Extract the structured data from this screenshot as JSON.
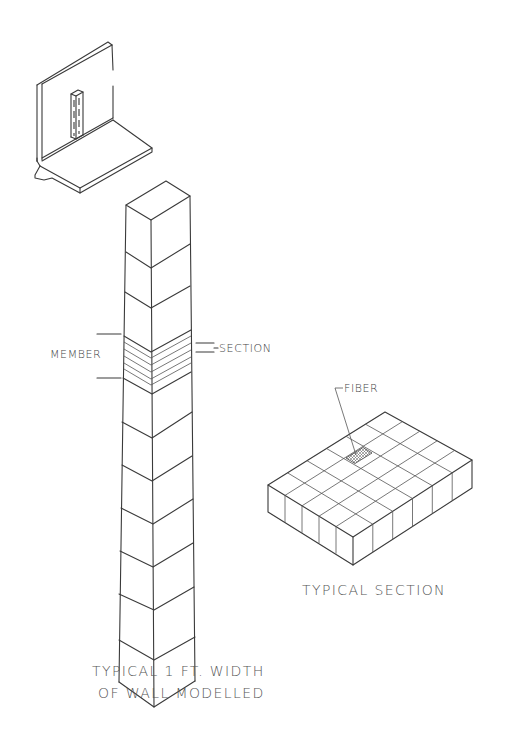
{
  "diagram": {
    "views": [
      {
        "id": "wall-isometric",
        "description": "Cantilever retaining wall with footing, 1 ft strip highlighted"
      },
      {
        "id": "wall-column",
        "description": "Typical 1 ft width of wall modelled as stacked members",
        "segments": 9
      },
      {
        "id": "typical-section",
        "description": "Fiber-discretized cross section",
        "grid_left_divisions": 6,
        "grid_right_divisions": 5
      }
    ],
    "labels": {
      "member": "MEMBER",
      "section": "SECTION",
      "fiber": "FIBER",
      "typical_section": "TYPICAL SECTION",
      "column_caption_line1": "TYPICAL 1 FT. WIDTH",
      "column_caption_line2": "OF WALL MODELLED"
    },
    "colors": {
      "line": "#3a3a3a",
      "text": "#444444",
      "background": "#ffffff"
    }
  }
}
